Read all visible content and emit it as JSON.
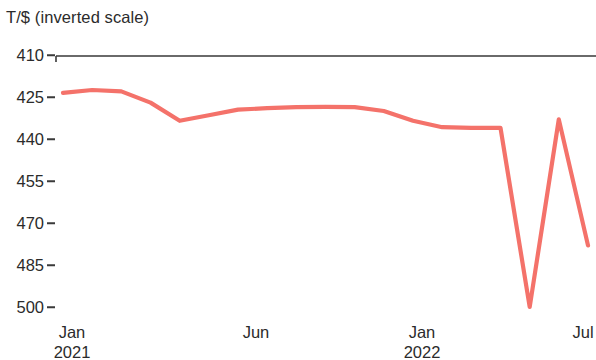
{
  "chart_data": {
    "type": "line",
    "title": "",
    "ylabel": "T/$ (inverted scale)",
    "xlabel": "",
    "inverted_y": true,
    "grid": false,
    "legend": "none",
    "line_color": "#f4726a",
    "axis_color": "#3a3a3a",
    "ylim": [
      410,
      500
    ],
    "yticks": [
      410,
      425,
      440,
      455,
      470,
      485,
      500
    ],
    "ytick_labels": [
      "410",
      "425",
      "440",
      "455",
      "470",
      "485",
      "500"
    ],
    "xticks": [
      "Jan 2021",
      "Jun",
      "Jan 2022",
      "Jul"
    ],
    "xtick_labels": [
      {
        "month": "Jan",
        "year": "2021"
      },
      {
        "month": "Jun",
        "year": ""
      },
      {
        "month": "Jan",
        "year": "2022"
      },
      {
        "month": "Jul",
        "year": ""
      }
    ],
    "x": [
      "2021-01",
      "2021-02",
      "2021-03",
      "2021-04",
      "2021-05",
      "2021-06",
      "2021-07",
      "2021-08",
      "2021-09",
      "2021-10",
      "2021-11",
      "2021-12",
      "2022-01",
      "2022-02",
      "2022-03",
      "2022-04",
      "2022-05",
      "2022-06",
      "2022-07"
    ],
    "series": [
      {
        "name": "T/$",
        "values": [
          423.5,
          422.5,
          423.0,
          427.0,
          433.5,
          431.5,
          429.5,
          429.0,
          428.6,
          428.5,
          428.6,
          430.0,
          433.5,
          435.8,
          436.0,
          436.0,
          500.0,
          433.0,
          478.0
        ]
      }
    ]
  }
}
